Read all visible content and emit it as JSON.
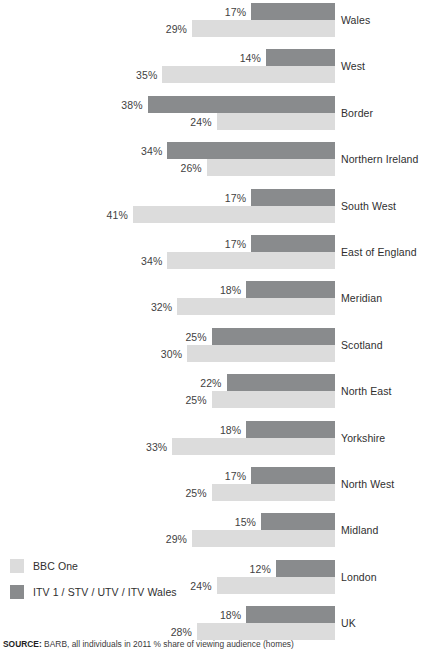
{
  "legend": {
    "items": [
      {
        "label": "BBC One",
        "color": "#dcdcdc",
        "key": "bbc"
      },
      {
        "label": "ITV 1 / STV / UTV / ITV Wales",
        "color": "#898b8d",
        "key": "itv"
      }
    ]
  },
  "source": {
    "label": "SOURCE:",
    "text": " BARB, all individuals in 2011 % share of viewing audience (homes)"
  },
  "chart_data": {
    "type": "bar",
    "orientation": "horizontal",
    "title": "",
    "subtitle": "",
    "xlabel": "",
    "ylabel": "",
    "value_unit": "%",
    "value_suffix": "%",
    "grid": false,
    "axis_visible": false,
    "bars_right_aligned": true,
    "xlim": [
      0,
      41
    ],
    "legend_position": "bottom-left",
    "categories": [
      "Wales",
      "West",
      "Border",
      "Northern Ireland",
      "South West",
      "East of England",
      "Meridian",
      "Scotland",
      "North East",
      "Yorkshire",
      "North West",
      "Midland",
      "London",
      "UK"
    ],
    "series": [
      {
        "name": "ITV 1 / STV / UTV / ITV Wales",
        "color": "#898b8d",
        "values": [
          17,
          14,
          38,
          34,
          17,
          17,
          18,
          25,
          22,
          18,
          17,
          15,
          12,
          18
        ],
        "labels": [
          "17%",
          "14%",
          "38%",
          "34%",
          "17%",
          "17%",
          "18%",
          "25%",
          "22%",
          "18%",
          "17%",
          "15%",
          "12%",
          "18%"
        ]
      },
      {
        "name": "BBC One",
        "color": "#dcdcdc",
        "values": [
          29,
          35,
          24,
          26,
          41,
          34,
          32,
          30,
          25,
          33,
          25,
          29,
          24,
          28
        ],
        "labels": [
          "29%",
          "35%",
          "24%",
          "26%",
          "41%",
          "34%",
          "32%",
          "30%",
          "25%",
          "33%",
          "25%",
          "29%",
          "24%",
          "28%"
        ]
      }
    ]
  }
}
